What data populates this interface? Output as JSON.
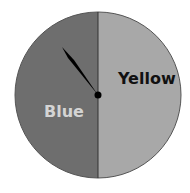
{
  "spinner": {
    "sections": [
      {
        "label": "Blue",
        "color": "#6e6e6e",
        "text_color": "#d4d4d4"
      },
      {
        "label": "Yellow",
        "color": "#a8a8a8",
        "text_color": "#111111"
      }
    ],
    "needle_color": "#000000",
    "pointing_to": "Blue"
  }
}
